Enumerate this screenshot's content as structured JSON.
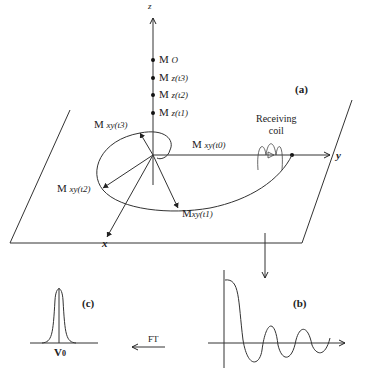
{
  "diagram": {
    "panel_a": {
      "label": "(a)",
      "axes": {
        "z": "z",
        "y": "y",
        "x": "x"
      },
      "z_points": [
        {
          "main": "M",
          "sub": "O"
        },
        {
          "main": "M",
          "sub": "z(t3)"
        },
        {
          "main": "M",
          "sub": "z(t2)"
        },
        {
          "main": "M",
          "sub": "z(t1)"
        }
      ],
      "xy_vectors": [
        {
          "main": "M",
          "sub": "xy(t0)"
        },
        {
          "main": "M",
          "sub": "xy(t1)"
        },
        {
          "main": "M",
          "sub": "xy(t2)"
        },
        {
          "main": "M",
          "sub": "xy(t3)"
        }
      ],
      "coil_label_line1": "Receiving",
      "coil_label_line2": "coil"
    },
    "panel_b": {
      "label": "(b)"
    },
    "panel_c": {
      "label": "(c)",
      "peak_label": "V",
      "peak_sub": "0"
    },
    "transform_label": "FT"
  }
}
